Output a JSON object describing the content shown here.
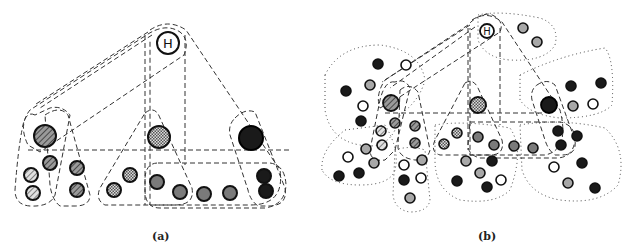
{
  "figure": {
    "panels": [
      {
        "id": "a",
        "caption": "(a)",
        "root_label": "H",
        "description": "Hierarchical grouping with dashed hulls around clusters of nodes"
      },
      {
        "id": "b",
        "caption": "(b)",
        "root_label": "H",
        "description": "Same hierarchy overlaid with dotted outer region hulls containing additional nodes"
      }
    ],
    "legend_fills": {
      "hatched": "diagonal-hatch",
      "checkered": "checker",
      "gray": "#7a7a7a",
      "light_gray": "#a8a8a8",
      "black": "#1a1a1a",
      "white": "#ffffff"
    },
    "line_styles": {
      "hierarchy_hull": "dashed",
      "region_hull": "dotted"
    }
  }
}
